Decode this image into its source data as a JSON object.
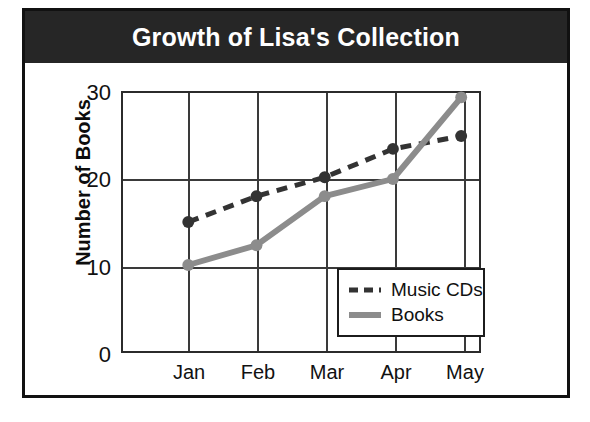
{
  "figure": {
    "title": "Growth of Lisa's Collection"
  },
  "chart_data": {
    "type": "line",
    "title": "Growth of Lisa's Collection",
    "xlabel": "",
    "ylabel": "Number of Books",
    "categories": [
      "Jan",
      "Feb",
      "Mar",
      "Apr",
      "May"
    ],
    "x_tick_labels": [
      "Jan",
      "Feb",
      "Mar",
      "Apr",
      "May"
    ],
    "y_tick_labels": [
      "0",
      "10",
      "20",
      "30"
    ],
    "y_ticks": [
      0,
      10,
      20,
      30
    ],
    "ylim": [
      0,
      30
    ],
    "grid": true,
    "legend_position": "lower-right-inside",
    "series": [
      {
        "name": "Music CDs",
        "values": [
          15,
          18,
          20.2,
          23.5,
          25
        ],
        "line_style": "dashed",
        "color": "#333333",
        "marker": "circle"
      },
      {
        "name": "Books",
        "values": [
          10,
          12.3,
          18,
          20,
          29.5
        ],
        "line_style": "solid",
        "color": "#8c8c8c",
        "marker": "circle"
      }
    ]
  },
  "legend": {
    "entries": [
      {
        "label": "Music CDs"
      },
      {
        "label": "Books"
      }
    ]
  },
  "colors": {
    "banner_background": "#262626",
    "banner_text": "#ffffff",
    "frame": "#111111",
    "grid": "#3a3a3a",
    "music_cds": "#333333",
    "books": "#8c8c8c"
  }
}
